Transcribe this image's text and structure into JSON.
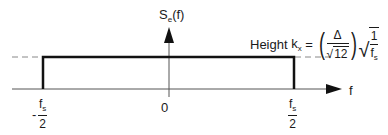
{
  "diagram": {
    "y_axis_label": "S",
    "y_axis_label_sub": "e",
    "y_axis_label_arg": "(f)",
    "x_axis_label": "f",
    "origin_label": "0",
    "left_tick": {
      "sign": "-",
      "numerator": "f",
      "numerator_sub": "s",
      "denominator": "2"
    },
    "right_tick": {
      "numerator": "f",
      "numerator_sub": "s",
      "denominator": "2"
    },
    "height_annotation": {
      "prefix": "Height",
      "symbol": "k",
      "symbol_sub": "x",
      "equals": "=",
      "delta": "Δ",
      "sqrt12": "12",
      "one": "1",
      "fs": "f",
      "fs_sub": "s"
    },
    "colors": {
      "line": "#1a1a1a",
      "dashed": "#888888"
    }
  }
}
